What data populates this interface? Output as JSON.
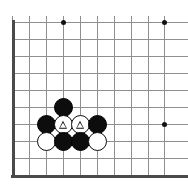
{
  "figure": {
    "title": "Go board corner diagram",
    "board_background": "#ffffff",
    "grid_color": "#8f8f8f",
    "edge_color": "#4a4a4a",
    "black_color": "#0d0d0d",
    "white_color": "#ffffff",
    "mark_color": "#0d0d0d",
    "width": 188,
    "height": 193
  },
  "board": {
    "view": "lower-left corner",
    "columns": 10,
    "rows": 10,
    "spacing": 17,
    "origin_x": 12,
    "origin_y": 22,
    "edges": [
      {
        "name": "left-edge",
        "orientation": "v",
        "x": 12,
        "y1": 20,
        "y2": 177
      },
      {
        "name": "bottom-edge",
        "orientation": "h",
        "y": 175,
        "x1": 11,
        "x2": 188
      }
    ],
    "vertical_lines": [
      12,
      29,
      46,
      63,
      80,
      97,
      114,
      131,
      148,
      164
    ],
    "horizontal_lines": [
      22,
      39,
      56,
      73,
      90,
      107,
      124,
      141,
      158,
      175
    ],
    "star_points": [
      {
        "name": "star-point-upper",
        "x": 63,
        "y": 22
      },
      {
        "name": "star-point-upper-right",
        "x": 164,
        "y": 22
      },
      {
        "name": "star-point-right",
        "x": 164,
        "y": 124
      }
    ]
  },
  "stones": [
    {
      "name": "black-stone-top",
      "color": "black",
      "x": 63,
      "y": 107,
      "mark": ""
    },
    {
      "name": "black-stone-left",
      "color": "black",
      "x": 46,
      "y": 124,
      "mark": ""
    },
    {
      "name": "white-stone-marked-left",
      "color": "white",
      "x": 63,
      "y": 124,
      "mark": "triangle"
    },
    {
      "name": "white-stone-marked-right",
      "color": "white",
      "x": 80,
      "y": 124,
      "mark": "triangle"
    },
    {
      "name": "black-stone-right",
      "color": "black",
      "x": 97,
      "y": 124,
      "mark": ""
    },
    {
      "name": "white-stone-bottom-left",
      "color": "white",
      "x": 46,
      "y": 141,
      "mark": ""
    },
    {
      "name": "black-stone-bottom-center-left",
      "color": "black",
      "x": 63,
      "y": 141,
      "mark": ""
    },
    {
      "name": "black-stone-bottom-center-right",
      "color": "black",
      "x": 80,
      "y": 141,
      "mark": ""
    },
    {
      "name": "white-stone-bottom-right",
      "color": "white",
      "x": 97,
      "y": 141,
      "mark": ""
    }
  ]
}
